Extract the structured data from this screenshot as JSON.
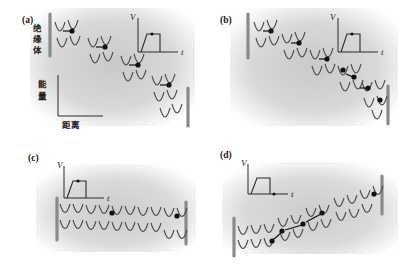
{
  "figure": {
    "background_color": "#ffffff",
    "shading_color": "#d6d6d6",
    "curve_color": "#4a4a4a",
    "electron_color": "#111111",
    "barrier_color": "#8a8a8a"
  },
  "labels": {
    "insulator": "绝缘体",
    "energy": "能量",
    "distance": "距离",
    "voltage_axis": "V",
    "time_axis": "t"
  },
  "panels": [
    {
      "id": "a",
      "label": "(a)",
      "tilt": "down-right",
      "description": "Strongly tilted potential wells under applied bias; isolated electrons hop one well at a time toward lower energy",
      "electron_count": 4,
      "arrow_count": 4,
      "shows_axes": true,
      "shows_insulator_label": true,
      "inset": {
        "voltage_label": "V",
        "time_label": "t",
        "pulse_shape": "square",
        "marker_position": "on-pulse-plateau"
      }
    },
    {
      "id": "b",
      "label": "(b)",
      "tilt": "down-right",
      "description": "Tilted potential wells with a dense chain of electrons cascading down the ladder",
      "electron_count": 7,
      "arrow_count": 5,
      "shows_axes": false,
      "shows_insulator_label": false,
      "inset": {
        "voltage_label": "V",
        "time_label": "t",
        "pulse_shape": "square",
        "marker_position": "on-pulse-plateau"
      }
    },
    {
      "id": "c",
      "label": "(c)",
      "tilt": "flat",
      "description": "Nearly flat periodic potential at low bias; electrons remain localized in separate wells",
      "electron_count": 2,
      "arrow_count": 0,
      "shows_axes": false,
      "shows_insulator_label": false,
      "inset": {
        "voltage_label": "V",
        "time_label": "t",
        "pulse_shape": "square",
        "marker_position": "on-pulse-plateau"
      }
    },
    {
      "id": "d",
      "label": "(d)",
      "tilt": "up-right",
      "description": "Reverse-tilted potential after the pulse ends; electrons relax back across the wells",
      "electron_count": 4,
      "arrow_count": 3,
      "shows_axes": false,
      "shows_insulator_label": false,
      "inset": {
        "voltage_label": "V",
        "time_label": "t",
        "pulse_shape": "square",
        "marker_position": "after-pulse-on-time-axis"
      }
    }
  ]
}
